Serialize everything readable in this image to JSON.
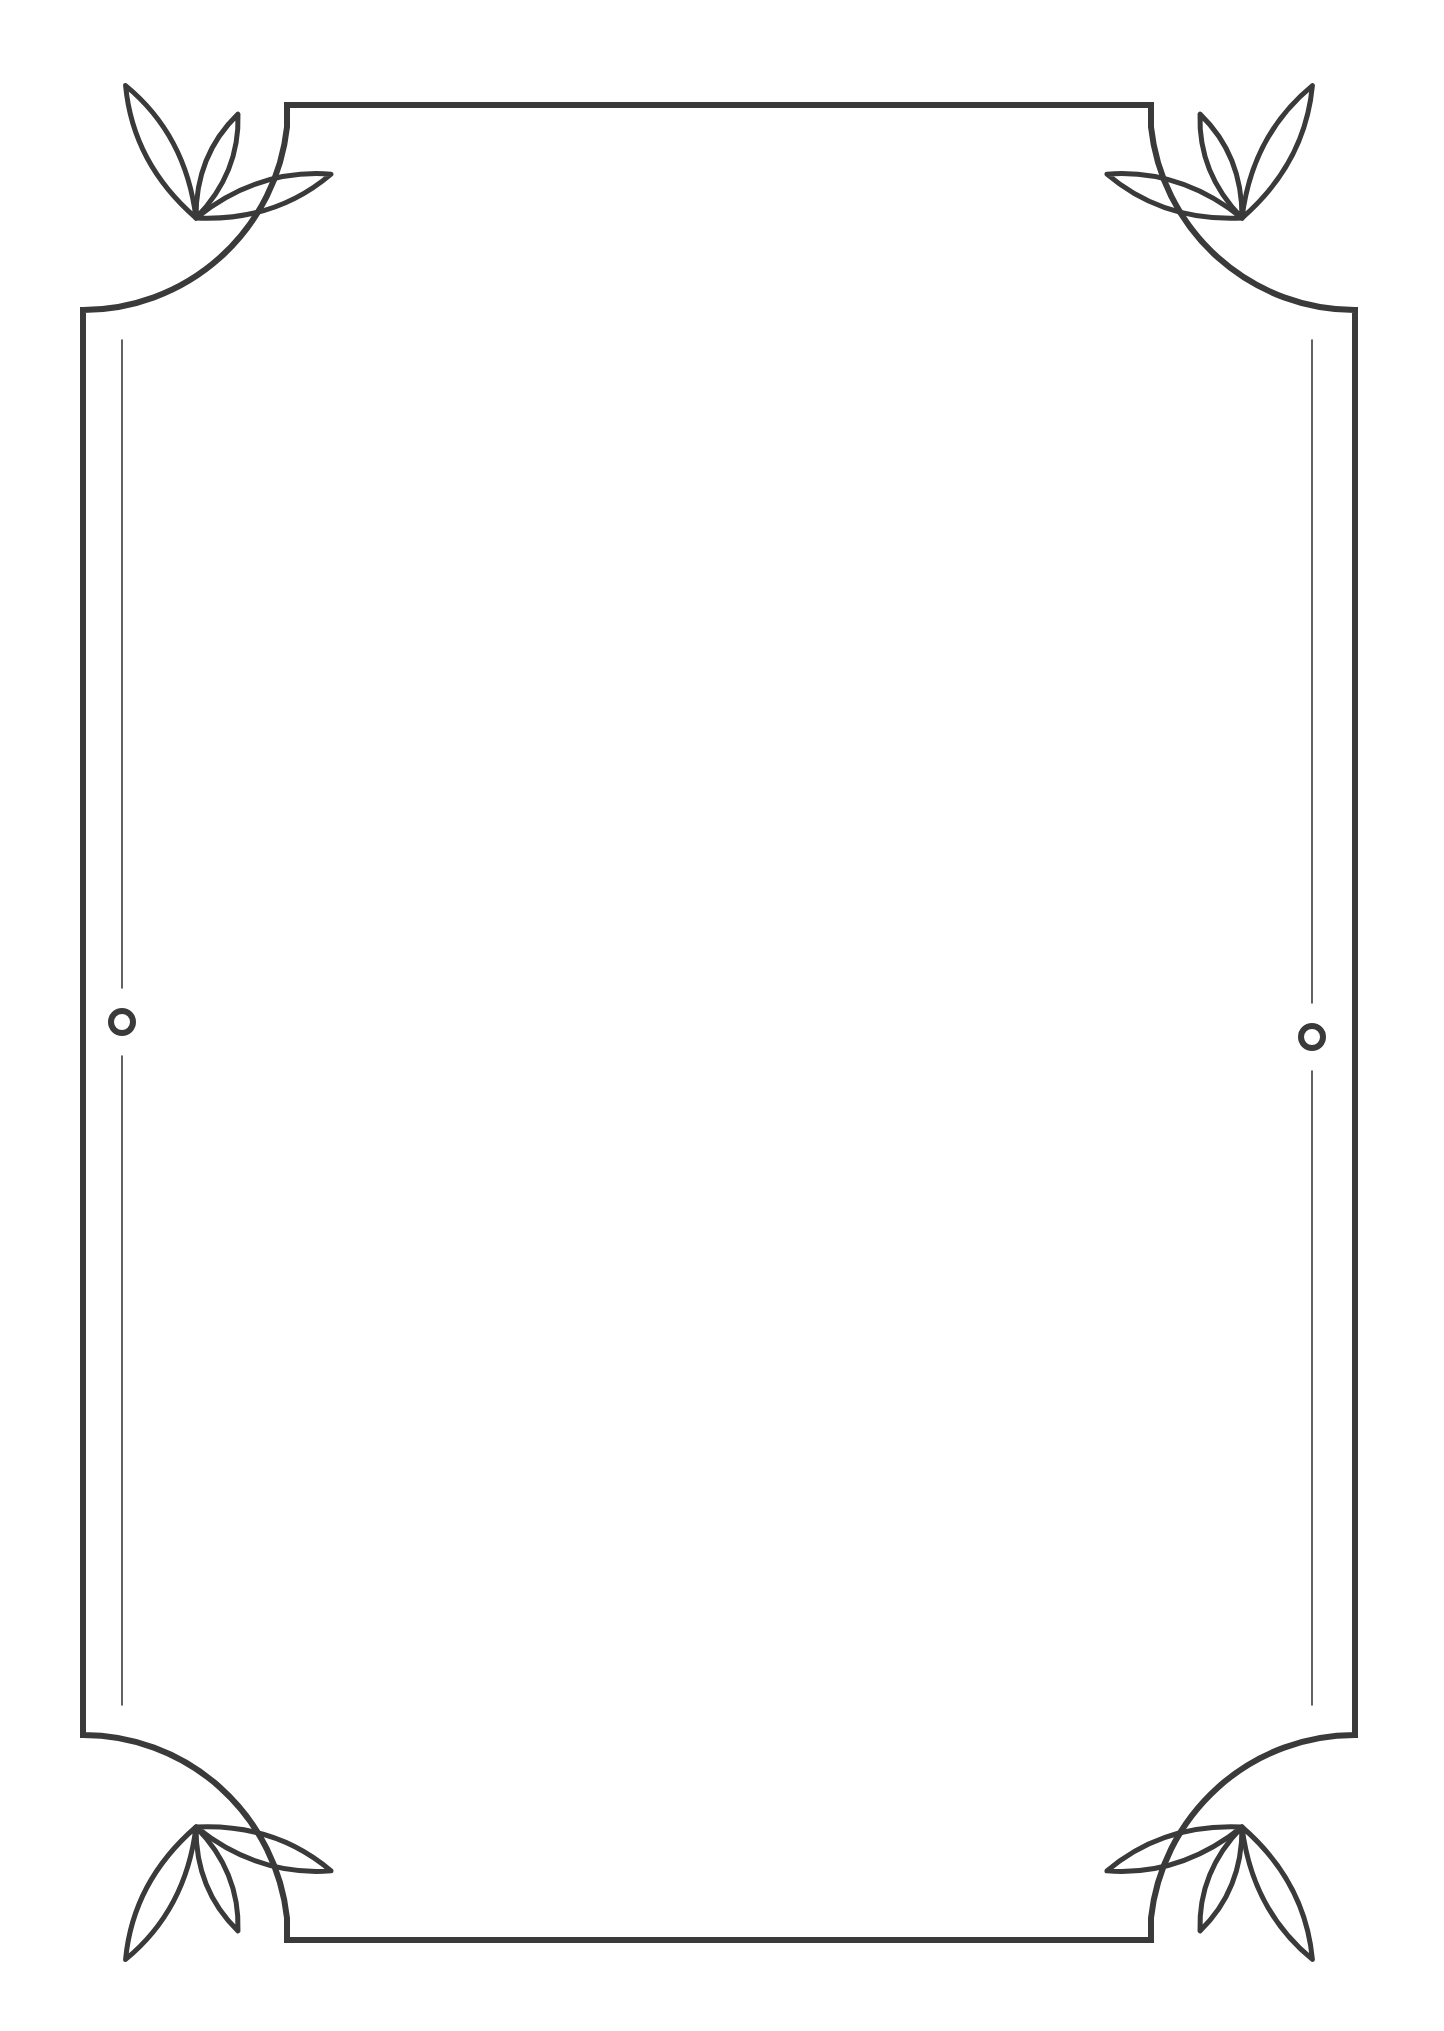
{
  "document": {
    "title": "Decorative Leaf Corner Frame",
    "description": "Blank bordered page template with three-leaf corner flourishes and side ring accents",
    "canvas": {
      "width": 1444,
      "height": 2031
    },
    "background_color": "#ffffff",
    "ink_color": "#3a3a3a"
  },
  "frame": {
    "name": "outer-border",
    "left": 83,
    "top": 105,
    "right": 1355,
    "bottom": 1940,
    "stroke_width": 6,
    "corner_cut_radius": 200,
    "edge_stub": 22,
    "style": "rounded-cut-corner rectangle"
  },
  "corner_ornaments": [
    {
      "id": "top-left",
      "label": "Top Left Leaf Trio",
      "pivot_x": 196,
      "pivot_y": 218,
      "rotation": 0,
      "leaf_count": 3
    },
    {
      "id": "top-right",
      "label": "Top Right Leaf Trio",
      "pivot_x": 1242,
      "pivot_y": 218,
      "rotation": 90,
      "leaf_count": 3
    },
    {
      "id": "bottom-left",
      "label": "Bottom Left Leaf Trio",
      "pivot_x": 196,
      "pivot_y": 1827,
      "rotation": 270,
      "leaf_count": 3
    },
    {
      "id": "bottom-right",
      "label": "Bottom Right Leaf Trio",
      "pivot_x": 1242,
      "pivot_y": 1827,
      "rotation": 180,
      "leaf_count": 3
    }
  ],
  "leaf_shape": {
    "description": "almond lens formed by two mirrored arcs meeting at sharp tips",
    "long_length": 150,
    "long_width": 56,
    "short_length": 112,
    "short_width": 46,
    "angles_deg": [
      -118,
      -68,
      -18
    ]
  },
  "side_accents": [
    {
      "id": "left-accent",
      "label": "Left Hairline With Ring",
      "x": 122,
      "line_top": 340,
      "line_bottom": 1705,
      "ring_center_y": 1022,
      "ring_radius": 11,
      "ring_gap": 34
    },
    {
      "id": "right-accent",
      "label": "Right Hairline With Ring",
      "x": 1312,
      "line_top": 340,
      "line_bottom": 1705,
      "ring_center_y": 1037,
      "ring_radius": 11,
      "ring_gap": 34
    }
  ],
  "content_area": {
    "label": "Blank Writing Area",
    "placeholder_text": "",
    "left": 130,
    "top": 150,
    "right": 1310,
    "bottom": 1895
  }
}
